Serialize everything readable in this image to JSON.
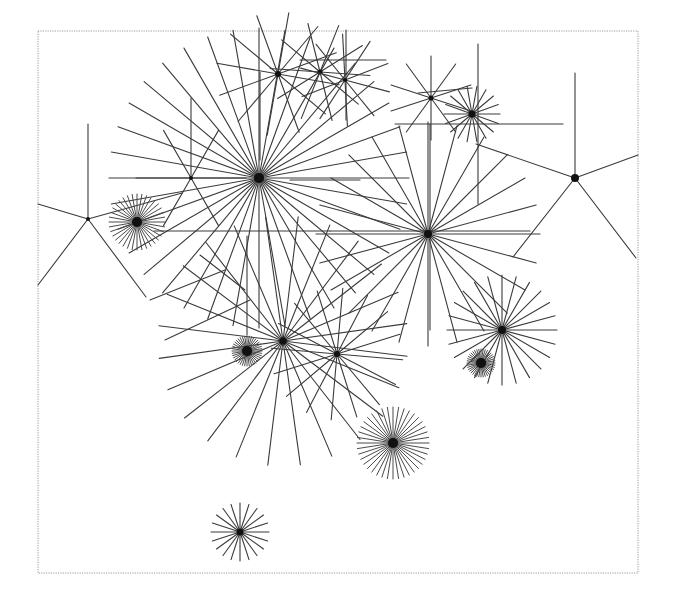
{
  "figure": {
    "frame": {
      "x": 38,
      "y": 31,
      "width": 600,
      "height": 542,
      "stroke": "#9a9a9a"
    },
    "ink_color": "#3a3a3a",
    "hub_color": "#111111",
    "background": "#ffffff"
  },
  "bursts": [
    {
      "id": "burst-a",
      "cx": 259,
      "cy": 178,
      "r": 150,
      "rays": 36,
      "phase": 0,
      "hub": 5,
      "dense": false
    },
    {
      "id": "burst-b",
      "cx": 428,
      "cy": 234,
      "r": 112,
      "rays": 24,
      "phase": 0,
      "hub": 4,
      "dense": false
    },
    {
      "id": "burst-c",
      "cx": 283,
      "cy": 341,
      "r": 125,
      "rays": 24,
      "phase": 7,
      "hub": 3.5,
      "dense": false
    },
    {
      "id": "burst-d",
      "cx": 337,
      "cy": 354,
      "r": 66,
      "rays": 16,
      "phase": 5,
      "hub": 3,
      "dense": false
    },
    {
      "id": "burst-e",
      "cx": 502,
      "cy": 330,
      "r": 55,
      "rays": 24,
      "phase": 0,
      "hub": 4,
      "dense": false
    },
    {
      "id": "burst-f",
      "cx": 137,
      "cy": 222,
      "r": 28,
      "rays": 36,
      "phase": 0,
      "hub": 5,
      "dense": true
    },
    {
      "id": "burst-g",
      "cx": 247,
      "cy": 351,
      "r": 15,
      "rays": 40,
      "phase": 0,
      "hub": 5,
      "dense": true
    },
    {
      "id": "burst-h",
      "cx": 481,
      "cy": 363,
      "r": 14,
      "rays": 40,
      "phase": 0,
      "hub": 5,
      "dense": true
    },
    {
      "id": "burst-i",
      "cx": 393,
      "cy": 443,
      "r": 36,
      "rays": 40,
      "phase": 0,
      "hub": 5,
      "dense": true
    },
    {
      "id": "burst-j",
      "cx": 240,
      "cy": 532,
      "r": 29,
      "rays": 20,
      "phase": 0,
      "hub": 3.5,
      "dense": false
    },
    {
      "id": "burst-k",
      "cx": 431,
      "cy": 98,
      "r": 42,
      "rays": 10,
      "phase": 18,
      "hub": 2.5,
      "dense": false
    },
    {
      "id": "burst-l",
      "cx": 472,
      "cy": 114,
      "r": 28,
      "rays": 18,
      "phase": 0,
      "hub": 3.5,
      "dense": false
    },
    {
      "id": "burst-m",
      "cx": 278,
      "cy": 74,
      "r": 62,
      "rays": 12,
      "phase": 10,
      "hub": 3,
      "dense": false
    },
    {
      "id": "burst-n",
      "cx": 320,
      "cy": 72,
      "r": 50,
      "rays": 10,
      "phase": 4,
      "hub": 2.5,
      "dense": false
    },
    {
      "id": "burst-o",
      "cx": 345,
      "cy": 80,
      "r": 46,
      "rays": 10,
      "phase": 15,
      "hub": 2,
      "dense": false
    },
    {
      "id": "burst-r",
      "cx": 191,
      "cy": 178,
      "r": 55,
      "rays": 6,
      "phase": 0,
      "hub": 2,
      "dense": false
    }
  ],
  "fans": [
    {
      "id": "fan-left",
      "cx": 88,
      "cy": 219,
      "hub": 2,
      "ends": [
        [
          88,
          124
        ],
        [
          38,
          204
        ],
        [
          38,
          285
        ],
        [
          146,
          297
        ],
        [
          182,
          193
        ]
      ]
    },
    {
      "id": "fan-right",
      "cx": 575,
      "cy": 178,
      "hub": 4,
      "ends": [
        [
          575,
          73
        ],
        [
          476,
          144
        ],
        [
          638,
          155
        ],
        [
          513,
          257
        ],
        [
          636,
          258
        ]
      ]
    }
  ],
  "segments": [
    [
      154,
      231,
      330,
      231
    ],
    [
      330,
      231,
      530,
      231
    ],
    [
      247,
      236,
      247,
      335
    ],
    [
      260,
      72,
      260,
      160
    ],
    [
      191,
      98,
      191,
      178
    ],
    [
      395,
      124,
      563,
      124
    ],
    [
      478,
      44,
      478,
      204
    ],
    [
      430,
      124,
      430,
      330
    ],
    [
      418,
      93,
      472,
      88
    ],
    [
      300,
      60,
      386,
      60
    ],
    [
      346,
      30,
      346,
      120
    ],
    [
      165,
      340,
      250,
      300
    ],
    [
      290,
      180,
      360,
      180
    ],
    [
      200,
      255,
      245,
      290
    ],
    [
      150,
      300,
      225,
      270
    ]
  ]
}
